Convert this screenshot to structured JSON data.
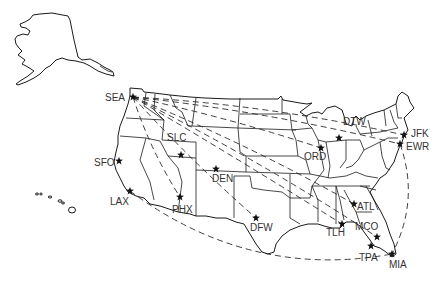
{
  "map": {
    "title": "US airport route map",
    "colors": {
      "land_stroke": "#1a1a1a",
      "route": "#2a2a2a",
      "marker": "#111111",
      "label": "#333333"
    },
    "marker_icon": "star-icon",
    "airports": [
      {
        "code": "SEA",
        "x": 133,
        "y": 97,
        "lx": 105,
        "ly": 101
      },
      {
        "code": "SLC",
        "x": 181,
        "y": 155,
        "lx": 167,
        "ly": 141
      },
      {
        "code": "SFO",
        "x": 119,
        "y": 161,
        "lx": 94,
        "ly": 166
      },
      {
        "code": "LAX",
        "x": 130,
        "y": 191,
        "lx": 110,
        "ly": 205
      },
      {
        "code": "PHX",
        "x": 180,
        "y": 197,
        "lx": 172,
        "ly": 213
      },
      {
        "code": "DEN",
        "x": 216,
        "y": 169,
        "lx": 212,
        "ly": 182
      },
      {
        "code": "DFW",
        "x": 256,
        "y": 218,
        "lx": 250,
        "ly": 231
      },
      {
        "code": "ORD",
        "x": 321,
        "y": 148,
        "lx": 304,
        "ly": 160
      },
      {
        "code": "DTW",
        "x": 339,
        "y": 138,
        "lx": 343,
        "ly": 125
      },
      {
        "code": "JFK",
        "x": 404,
        "y": 135,
        "lx": 411,
        "ly": 137
      },
      {
        "code": "EWR",
        "x": 400,
        "y": 144,
        "lx": 406,
        "ly": 150
      },
      {
        "code": "ATL",
        "x": 354,
        "y": 204,
        "lx": 357,
        "ly": 210
      },
      {
        "code": "TLH",
        "x": 342,
        "y": 224,
        "lx": 326,
        "ly": 236
      },
      {
        "code": "MCO",
        "x": 377,
        "y": 237,
        "lx": 355,
        "ly": 230
      },
      {
        "code": "TPA",
        "x": 371,
        "y": 246,
        "lx": 359,
        "ly": 261
      },
      {
        "code": "MIA",
        "x": 392,
        "y": 254,
        "lx": 389,
        "ly": 268
      }
    ],
    "routes": [
      {
        "from": "SEA",
        "to": "JFK"
      },
      {
        "from": "SEA",
        "to": "EWR"
      },
      {
        "from": "SEA",
        "to": "ORD"
      },
      {
        "from": "SEA",
        "to": "ATL"
      },
      {
        "from": "SEA",
        "to": "MCO"
      },
      {
        "from": "SEA",
        "to": "TLH"
      },
      {
        "from": "SEA",
        "to": "DFW"
      },
      {
        "from": "SEA",
        "to": "PHX"
      },
      {
        "from": "LAX",
        "to": "MIA"
      },
      {
        "from": "EWR",
        "to": "MIA"
      }
    ]
  }
}
